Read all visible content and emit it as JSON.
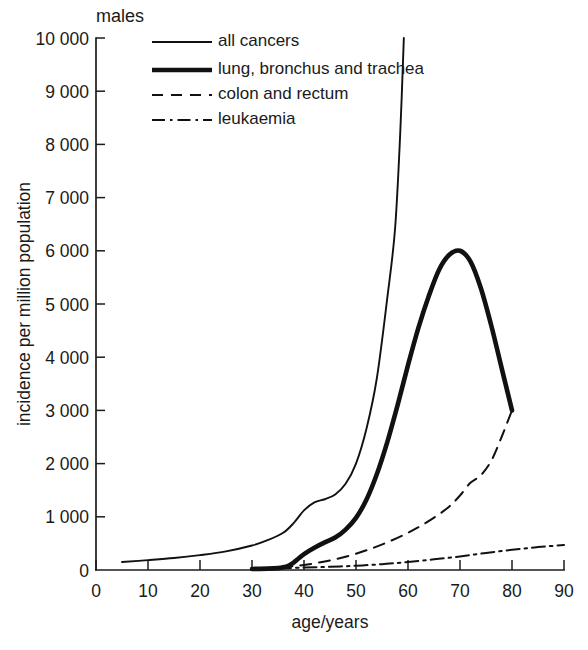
{
  "figure": {
    "panel_label": "males",
    "background": "#ffffff",
    "ink_color": "#111111"
  },
  "chart_data": {
    "type": "line",
    "title": "males",
    "xlabel": "age/years",
    "ylabel": "incidence per million population",
    "xlim": [
      0,
      90
    ],
    "ylim": [
      0,
      10000
    ],
    "xticks": [
      0,
      10,
      20,
      30,
      40,
      50,
      60,
      70,
      80,
      90
    ],
    "xtick_labels": [
      "0",
      "10",
      "20",
      "30",
      "40",
      "50",
      "60",
      "70",
      "80",
      "90"
    ],
    "yticks": [
      0,
      1000,
      2000,
      3000,
      4000,
      5000,
      6000,
      7000,
      8000,
      9000,
      10000
    ],
    "ytick_labels": [
      "0",
      "1 000",
      "2 000",
      "3 000",
      "4 000",
      "5 000",
      "6 000",
      "7 000",
      "8 000",
      "9 000",
      "10 000"
    ],
    "grid": false,
    "legend_position": "top-left-inside",
    "series": [
      {
        "name": "all cancers",
        "style": "solid-thin",
        "x": [
          5,
          10,
          15,
          20,
          25,
          30,
          33,
          36,
          38,
          40,
          42,
          44,
          46,
          48,
          50,
          52,
          54,
          56,
          57.5,
          58.5,
          59.2
        ],
        "y": [
          150,
          185,
          225,
          280,
          350,
          460,
          560,
          700,
          880,
          1120,
          1270,
          1330,
          1420,
          1620,
          2000,
          2650,
          3600,
          5100,
          6400,
          8200,
          10000
        ]
      },
      {
        "name": "lung, bronchus and trachea",
        "style": "solid-thick",
        "x": [
          30,
          33,
          35,
          36,
          37,
          38,
          39,
          40,
          42,
          44,
          46,
          48,
          50,
          52,
          54,
          56,
          58,
          60,
          62,
          64,
          66,
          68,
          70,
          72,
          74,
          76,
          78,
          80
        ],
        "y": [
          20,
          25,
          35,
          50,
          80,
          140,
          220,
          300,
          420,
          520,
          610,
          760,
          980,
          1320,
          1800,
          2400,
          3100,
          3850,
          4550,
          5150,
          5650,
          5930,
          6000,
          5800,
          5300,
          4600,
          3800,
          3000
        ]
      },
      {
        "name": "colon and rectum",
        "style": "dashed",
        "x": [
          32,
          36,
          40,
          44,
          48,
          52,
          56,
          60,
          63,
          66,
          68,
          70,
          72,
          74,
          76,
          78,
          80
        ],
        "y": [
          30,
          55,
          95,
          160,
          250,
          370,
          520,
          700,
          860,
          1050,
          1200,
          1400,
          1640,
          1780,
          2050,
          2500,
          3000
        ]
      },
      {
        "name": "leukaemia",
        "style": "dash-dot",
        "x": [
          35,
          40,
          45,
          50,
          55,
          60,
          65,
          70,
          75,
          80,
          85,
          90
        ],
        "y": [
          35,
          45,
          60,
          80,
          110,
          150,
          200,
          255,
          320,
          380,
          430,
          470
        ]
      }
    ]
  },
  "legend": {
    "items": [
      {
        "label": "all cancers",
        "style": "solid-thin"
      },
      {
        "label": "lung, bronchus and trachea",
        "style": "solid-thick"
      },
      {
        "label": "colon and rectum",
        "style": "dashed"
      },
      {
        "label": "leukaemia",
        "style": "dash-dot"
      }
    ]
  }
}
